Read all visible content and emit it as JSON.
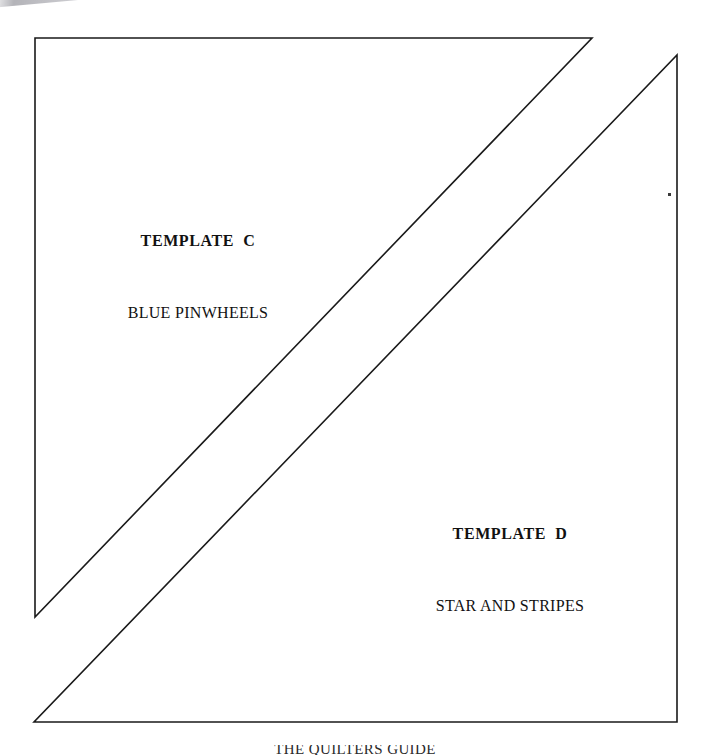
{
  "page": {
    "background_color": "#ffffff",
    "line_color": "#1a1a1a",
    "width": 710,
    "height": 755
  },
  "templates": [
    {
      "id": "c",
      "title": "TEMPLATE  C",
      "pattern_name": "BLUE PINWHEELS",
      "shape": "right-triangle",
      "points": "35,38 592,38 35,617"
    },
    {
      "id": "d",
      "title": "TEMPLATE  D",
      "pattern_name": "STAR AND STRIPES",
      "shape": "right-triangle",
      "points": "677,55 677,722 34,722"
    }
  ],
  "artifacts": {
    "bottom_clipped_text": "THE QUILTERS GUIDE"
  }
}
